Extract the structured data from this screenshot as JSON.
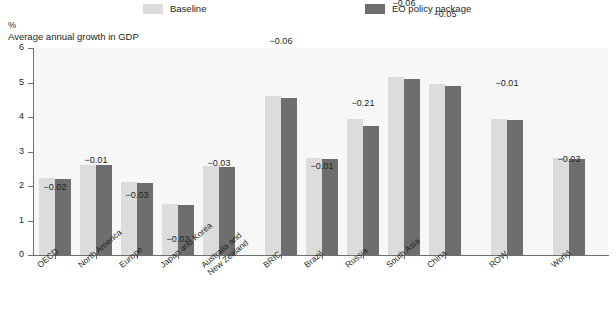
{
  "legend": {
    "items": [
      {
        "label": "Baseline",
        "color": "#dcdcdc",
        "key": "baseline"
      },
      {
        "label": "EO policy package",
        "color": "#6e6e6e",
        "key": "eo"
      }
    ]
  },
  "axes": {
    "unit": "%",
    "y_title": "Average annual growth in GDP",
    "y_ticks": [
      "0",
      "1",
      "2",
      "3",
      "4",
      "5",
      "6"
    ]
  },
  "chart_data": {
    "type": "bar",
    "title": "Average annual growth in GDP",
    "subtitle": "",
    "xlabel": "",
    "ylabel": "Average annual growth in GDP",
    "unit": "%",
    "ylim": [
      0,
      6
    ],
    "yticks": [
      0,
      1,
      2,
      3,
      4,
      5,
      6
    ],
    "grid": false,
    "legend_position": "top",
    "categories": [
      "OECD",
      "North America",
      "Europe",
      "Japan and Korea",
      "Australia and\nNew Zealand",
      "BRIC",
      "Brazil",
      "Russia",
      "South Asia",
      "China",
      "ROW",
      "World"
    ],
    "series": [
      {
        "name": "Baseline",
        "color": "#dcdcdc",
        "values": [
          2.22,
          2.62,
          2.12,
          1.47,
          2.58,
          4.62,
          2.8,
          3.95,
          5.16,
          4.95,
          3.93,
          2.8
        ]
      },
      {
        "name": "EO policy package",
        "color": "#6e6e6e",
        "values": [
          2.2,
          2.61,
          2.09,
          1.45,
          2.55,
          4.56,
          2.79,
          3.74,
          5.1,
          4.9,
          3.92,
          2.77
        ]
      }
    ],
    "annotations": [
      {
        "category": "OECD",
        "text": "−0.02"
      },
      {
        "category": "North America",
        "text": "−0.01"
      },
      {
        "category": "Europe",
        "text": "−0.03"
      },
      {
        "category": "Japan and Korea",
        "text": "−0.02"
      },
      {
        "category": "Australia and New Zealand",
        "text": "−0.03"
      },
      {
        "category": "BRIC",
        "text": "−0.06"
      },
      {
        "category": "Brazil",
        "text": "−0.01"
      },
      {
        "category": "Russia",
        "text": "−0.21"
      },
      {
        "category": "South Asia",
        "text": "−0.06"
      },
      {
        "category": "China",
        "text": "−0.05"
      },
      {
        "category": "ROW",
        "text": "−0.01"
      },
      {
        "category": "World",
        "text": "−0.03"
      }
    ],
    "group_layout": [
      {
        "category": "OECD",
        "x": 6,
        "label_dx": 6,
        "label_dy": 0,
        "ann_dy": 18
      },
      {
        "category": "North America",
        "x": 47,
        "label_dx": 47,
        "label_dy": 0,
        "ann_dy": 4
      },
      {
        "category": "Europe",
        "x": 88,
        "label_dx": 88,
        "label_dy": 0,
        "ann_dy": 22
      },
      {
        "category": "Japan and Korea",
        "x": 129,
        "label_dx": 129,
        "label_dy": 0,
        "ann_dy": 44
      },
      {
        "category": "Australia and\nNew Zealand",
        "x": 170,
        "label_dx": 170,
        "label_dy": 0,
        "ann_dy": 6
      },
      {
        "category": "BRIC",
        "x": 232,
        "label_dx": 232,
        "label_dy": 0,
        "ann_dy": -46
      },
      {
        "category": "Brazil",
        "x": 273,
        "label_dx": 273,
        "label_dy": 0,
        "ann_dy": 17
      },
      {
        "category": "Russia",
        "x": 314,
        "label_dx": 314,
        "label_dy": 0,
        "ann_dy": -7
      },
      {
        "category": "South Asia",
        "x": 355,
        "label_dx": 355,
        "label_dy": 0,
        "ann_dy": -65
      },
      {
        "category": "China",
        "x": 396,
        "label_dx": 396,
        "label_dy": 0,
        "ann_dy": -61
      },
      {
        "category": "ROW",
        "x": 458,
        "label_dx": 458,
        "label_dy": 0,
        "ann_dy": -27
      },
      {
        "category": "World",
        "x": 520,
        "label_dx": 520,
        "label_dy": 0,
        "ann_dy": 10
      }
    ]
  }
}
